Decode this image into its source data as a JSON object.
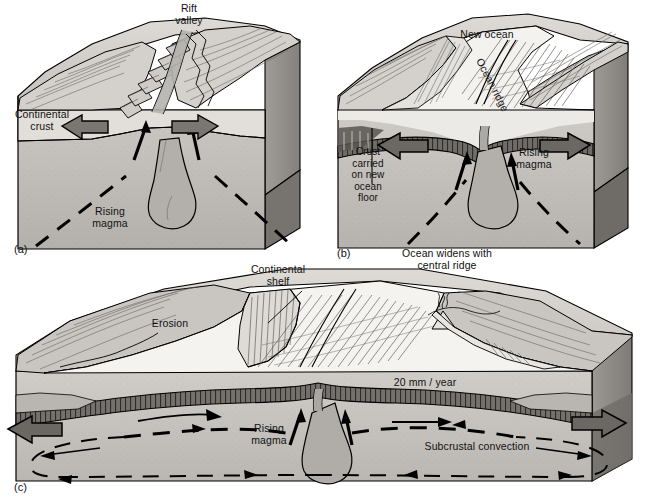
{
  "figure": {
    "panels": [
      {
        "id": "a",
        "id_label": "(a)",
        "caption": "",
        "labels": [
          {
            "name": "rift-valley",
            "text": "Rift\nvalley"
          },
          {
            "name": "continental-crust",
            "text": "Continental\ncrust"
          },
          {
            "name": "rising-magma",
            "text": "Rising\nmagma"
          }
        ]
      },
      {
        "id": "b",
        "id_label": "(b)",
        "caption": "Ocean widens with\ncentral ridge",
        "labels": [
          {
            "name": "new-ocean",
            "text": "New ocean"
          },
          {
            "name": "ocean-ridge",
            "text": "Ocean ridge"
          },
          {
            "name": "crust-carried",
            "text": "Crust\ncarried\non new\nocean\nfloor"
          },
          {
            "name": "rising-magma",
            "text": "Rising\nmagma"
          }
        ]
      },
      {
        "id": "c",
        "id_label": "(c)",
        "caption": "",
        "labels": [
          {
            "name": "continental-shelf",
            "text": "Continental\nshelf"
          },
          {
            "name": "erosion",
            "text": "Erosion"
          },
          {
            "name": "spreading-rate",
            "text": "20 mm / year"
          },
          {
            "name": "rising-magma",
            "text": "Rising\nmagma"
          },
          {
            "name": "subcrustal-convection",
            "text": "Subcrustal convection"
          }
        ]
      }
    ]
  },
  "colors": {
    "background": "#ffffff",
    "outline": "#000000",
    "block_top_light": "#d8d5d0",
    "block_top_mid": "#c6c3bd",
    "block_face_light": "#c9c6c1",
    "block_face_dark": "#a9a6a1",
    "block_side_dark": "#8d8a85",
    "ocean_water": "#f2f1ee",
    "magma_fill": "#b3b0ab",
    "oceanic_crust": "#6f6c68",
    "arrow_fill": "#7a7772",
    "land_mid": "#bcb9b4"
  },
  "icons": {
    "spread_arrow_left": "arrow-left-icon",
    "spread_arrow_right": "arrow-right-icon",
    "magma_arrow_up": "arrow-up-icon",
    "flow_arrow": "arrow-icon",
    "volcano": "volcano-icon"
  }
}
